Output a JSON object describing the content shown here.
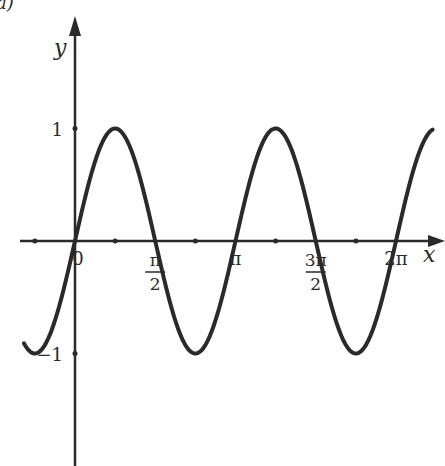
{
  "figure": {
    "panel_label": "a)",
    "background": "#ffffff",
    "ink_color": "#2a2a2a"
  },
  "chart_data": {
    "type": "line",
    "title": "",
    "function": "y = sin(2x)",
    "xlabel": "x",
    "ylabel": "y",
    "x_ticks": [
      {
        "value": 0,
        "label": "0"
      },
      {
        "value": 1.5708,
        "label": "π/2",
        "num": "π",
        "den": "2"
      },
      {
        "value": 3.1416,
        "label": "π"
      },
      {
        "value": 4.7124,
        "label": "3π/2",
        "num": "3π",
        "den": "2"
      },
      {
        "value": 6.2832,
        "label": "2π"
      }
    ],
    "x_minor_ticks": [
      -0.7854,
      0.7854,
      2.3562,
      3.927,
      5.4978
    ],
    "y_ticks": [
      {
        "value": 1,
        "label": "1"
      },
      {
        "value": -1,
        "label": "−1"
      }
    ],
    "xlim": [
      -1.07,
      7.0
    ],
    "ylim": [
      -1.95,
      1.75
    ],
    "grid": false,
    "legend": null,
    "series": [
      {
        "name": "sin(2x)",
        "x": [
          -1.0,
          -0.7854,
          -0.3927,
          0,
          0.3927,
          0.7854,
          1.1781,
          1.5708,
          1.9635,
          2.3562,
          2.7489,
          3.1416,
          3.5343,
          3.927,
          4.3197,
          4.7124,
          5.1051,
          5.4978,
          5.8905,
          6.2832,
          6.6759,
          7.0
        ],
        "y": [
          -0.909,
          -1,
          -0.707,
          0,
          0.707,
          1,
          0.707,
          0,
          -0.707,
          -1,
          -0.707,
          0,
          0.707,
          1,
          0.707,
          0,
          -0.707,
          -1,
          -0.707,
          0,
          0.707,
          0.99
        ]
      }
    ]
  }
}
